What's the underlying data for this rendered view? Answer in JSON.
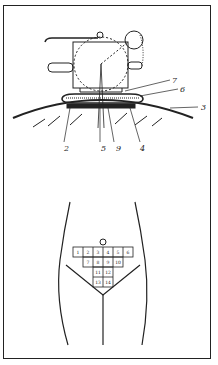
{
  "figure_top": {
    "description": "Applicator device placed on curved skin surface",
    "labels": [
      {
        "id": "7",
        "x": 172,
        "y": 83
      },
      {
        "id": "6",
        "x": 180,
        "y": 92
      },
      {
        "id": "3",
        "x": 201,
        "y": 110
      },
      {
        "id": "2",
        "x": 64,
        "y": 151
      },
      {
        "id": "5",
        "x": 101,
        "y": 151
      },
      {
        "id": "9",
        "x": 116,
        "y": 151
      },
      {
        "id": "4",
        "x": 140,
        "y": 151
      }
    ]
  },
  "figure_bottom": {
    "description": "Lower torso outline with numbered grid of application zones",
    "grid_rows": [
      [
        "1",
        "2",
        "3",
        "4",
        "5",
        "6"
      ],
      [
        "7",
        "8",
        "9",
        "10"
      ],
      [
        "11",
        "12"
      ],
      [
        "13",
        "14"
      ]
    ]
  }
}
